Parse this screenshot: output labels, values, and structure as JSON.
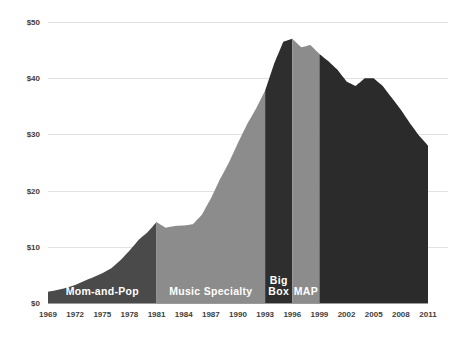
{
  "chart_data": {
    "type": "area",
    "title": "",
    "subtitle": "",
    "xlabel": "",
    "ylabel": "",
    "xlim": [
      1969,
      2011
    ],
    "ylim": [
      0,
      50
    ],
    "grid": true,
    "legend_position": "none",
    "y_ticks": [
      "$0",
      "$10",
      "$20",
      "$30",
      "$40",
      "$50"
    ],
    "y_tick_values": [
      0,
      10,
      20,
      30,
      40,
      50
    ],
    "x_ticks": [
      "1969",
      "1972",
      "1975",
      "1978",
      "1981",
      "1984",
      "1987",
      "1990",
      "1993",
      "1996",
      "1999",
      "2002",
      "2005",
      "2008",
      "2011"
    ],
    "x_tick_values": [
      1969,
      1972,
      1975,
      1978,
      1981,
      1984,
      1987,
      1990,
      1993,
      1996,
      1999,
      2002,
      2005,
      2008,
      2011
    ],
    "x": [
      1969,
      1970,
      1971,
      1972,
      1973,
      1974,
      1975,
      1976,
      1977,
      1978,
      1979,
      1980,
      1981,
      1982,
      1983,
      1984,
      1985,
      1986,
      1987,
      1988,
      1989,
      1990,
      1991,
      1992,
      1993,
      1994,
      1995,
      1996,
      1997,
      1998,
      1999,
      2000,
      2001,
      2002,
      2003,
      2004,
      2005,
      2006,
      2007,
      2008,
      2009,
      2010,
      2011
    ],
    "values": [
      2.0,
      2.3,
      2.7,
      3.2,
      3.9,
      4.6,
      5.3,
      6.2,
      7.6,
      9.3,
      11.2,
      12.6,
      14.4,
      13.4,
      13.7,
      13.8,
      14.0,
      15.7,
      18.6,
      22.0,
      25.0,
      28.5,
      31.8,
      34.6,
      37.8,
      42.6,
      46.5,
      47.0,
      45.5,
      45.9,
      44.3,
      43.0,
      41.5,
      39.4,
      38.6,
      40.0,
      40.0,
      38.6,
      36.5,
      34.4,
      32.0,
      29.8,
      28.0
    ],
    "series": [
      {
        "name": "US recorded music revenue",
        "values": [
          2.0,
          2.3,
          2.7,
          3.2,
          3.9,
          4.6,
          5.3,
          6.2,
          7.6,
          9.3,
          11.2,
          12.6,
          14.4,
          13.4,
          13.7,
          13.8,
          14.0,
          15.7,
          18.6,
          22.0,
          25.0,
          28.5,
          31.8,
          34.6,
          37.8,
          42.6,
          46.5,
          47.0,
          45.5,
          45.9,
          44.3,
          43.0,
          41.5,
          39.4,
          38.6,
          40.0,
          40.0,
          38.6,
          36.5,
          34.4,
          32.0,
          29.8,
          28.0
        ]
      }
    ],
    "annotations": [
      {
        "label": "Mom-and-Pop",
        "start_year": 1969,
        "end_year": 1981,
        "color": "#4a4a4a",
        "lines": [
          "Mom-and-Pop"
        ]
      },
      {
        "label": "Music Specialty",
        "start_year": 1981,
        "end_year": 1993,
        "color": "#8c8c8c",
        "lines": [
          "Music Specialty"
        ]
      },
      {
        "label": "Big Box",
        "start_year": 1993,
        "end_year": 1996,
        "color": "#2e2e2e",
        "lines": [
          "Big",
          "Box"
        ]
      },
      {
        "label": "MAP",
        "start_year": 1996,
        "end_year": 1999,
        "color": "#8c8c8c",
        "lines": [
          "MAP"
        ]
      },
      {
        "label": "",
        "start_year": 1999,
        "end_year": 2011,
        "color": "#2b2b2b",
        "lines": []
      }
    ],
    "colors": {
      "era_dark": "#4a4a4a",
      "era_light": "#8c8c8c",
      "era_bigbox": "#2e2e2e",
      "era_final": "#2b2b2b",
      "gridline": "#e2e2e2",
      "axis_text": "#3d3d3d",
      "era_label_text": "#ffffff",
      "background": "#ffffff"
    }
  }
}
